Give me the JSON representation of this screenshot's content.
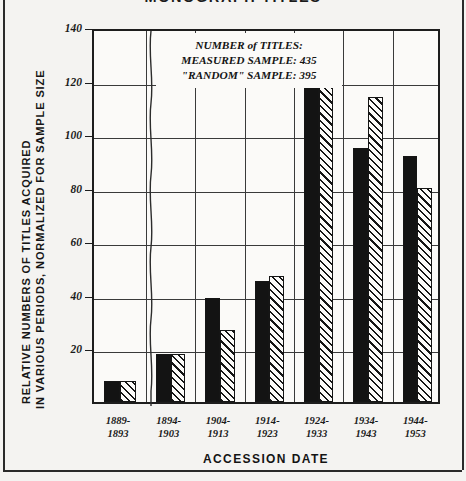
{
  "chart_data": {
    "type": "bar",
    "title": "MONOGRAPH TITLES",
    "xlabel": "ACCESSION DATE",
    "ylabel_line1": "RELATIVE NUMBERS OF TITLES ACQUIRED",
    "ylabel_line2": "IN VARIOUS PERIODS, NORMALIZED FOR SAMPLE SIZE",
    "categories": [
      "1889-\n1893",
      "1894-\n1903",
      "1904-\n1913",
      "1914-\n1923",
      "1924-\n1933",
      "1934-\n1943",
      "1944-\n1953"
    ],
    "category_lines": [
      [
        "1889-",
        "1893"
      ],
      [
        "1894-",
        "1903"
      ],
      [
        "1904-",
        "1913"
      ],
      [
        "1914-",
        "1923"
      ],
      [
        "1924-",
        "1933"
      ],
      [
        "1934-",
        "1943"
      ],
      [
        "1944-",
        "1953"
      ]
    ],
    "series": [
      {
        "name": "MEASURED SAMPLE",
        "style": "solid-black",
        "values": [
          8,
          18,
          39,
          45,
          133,
          95,
          92
        ]
      },
      {
        "name": "\"RANDOM\" SAMPLE",
        "style": "hatched",
        "values": [
          8,
          18,
          27,
          47,
          136,
          114,
          80
        ]
      }
    ],
    "ylim": [
      0,
      140
    ],
    "yticks": [
      20,
      40,
      60,
      80,
      100,
      120,
      140
    ],
    "ytick_labels": [
      "20",
      "40",
      "60",
      "80",
      "100",
      "120",
      "140"
    ],
    "grid": true,
    "legend_position": "none",
    "axis_break": "between first and second category",
    "annotation": {
      "line1": "NUMBER of TITLES:",
      "line2": "MEASURED SAMPLE:  435",
      "line3": "\"RANDOM\" SAMPLE:  395"
    }
  }
}
